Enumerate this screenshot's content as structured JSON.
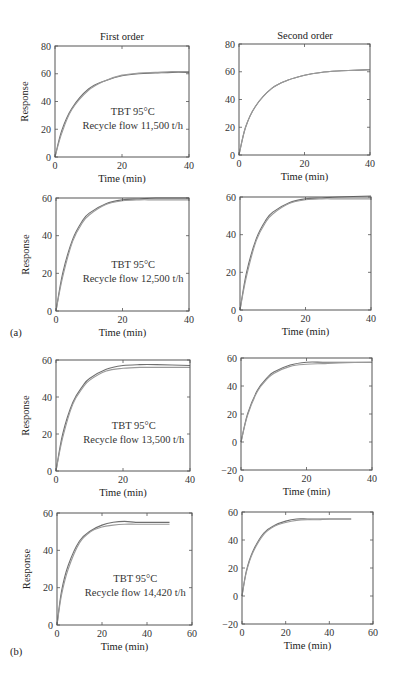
{
  "figure": {
    "column_titles": [
      "First order",
      "Second order"
    ],
    "part_labels": [
      "(a)",
      "(b)"
    ],
    "xlabel": "Time (min)",
    "ylabel": "Response",
    "annotation_line1": "TBT 95°C",
    "line_color": "#777777"
  },
  "chart_data": [
    {
      "type": "line",
      "title": "First order",
      "row": 0,
      "col": 0,
      "annotation": [
        "TBT 95°C",
        "Recycle flow 11,500 t/h"
      ],
      "xlabel": "Time (min)",
      "ylabel": "Response",
      "xlim": [
        0,
        40
      ],
      "ylim": [
        0,
        80
      ],
      "xticks": [
        0,
        20,
        40
      ],
      "yticks": [
        0,
        20,
        40,
        60,
        80
      ],
      "series": [
        {
          "name": "measured",
          "x": [
            0,
            2,
            5,
            10,
            15,
            20,
            25,
            30,
            35,
            40
          ],
          "y": [
            0,
            19,
            35,
            49,
            55,
            58.5,
            60,
            60.5,
            61,
            61
          ]
        },
        {
          "name": "first-order model",
          "x": [
            0,
            2,
            5,
            10,
            15,
            20,
            25,
            30,
            35,
            40
          ],
          "y": [
            0,
            17,
            34,
            48,
            55,
            59,
            60.5,
            61,
            61.5,
            61.5
          ]
        }
      ]
    },
    {
      "type": "line",
      "title": "Second order",
      "row": 0,
      "col": 1,
      "xlabel": "Time (min)",
      "ylabel": "",
      "xlim": [
        0,
        40
      ],
      "ylim": [
        0,
        80
      ],
      "xticks": [
        0,
        20,
        40
      ],
      "yticks": [
        0,
        20,
        40,
        60,
        80
      ],
      "series": [
        {
          "name": "measured",
          "x": [
            0,
            2,
            5,
            10,
            15,
            20,
            25,
            30,
            35,
            40
          ],
          "y": [
            0,
            20,
            35,
            48,
            54,
            57.5,
            59.5,
            60.5,
            61,
            61.5
          ]
        },
        {
          "name": "second-order model",
          "x": [
            0,
            2,
            5,
            10,
            15,
            20,
            25,
            30,
            35,
            40
          ],
          "y": [
            0,
            20,
            35,
            48,
            54,
            57.5,
            59.5,
            60.5,
            61,
            61.5
          ]
        }
      ]
    },
    {
      "type": "line",
      "title": "",
      "row": 1,
      "col": 0,
      "annotation": [
        "TBT 95°C",
        "Recycle flow 12,500 t/h"
      ],
      "xlabel": "Time (min)",
      "ylabel": "Response",
      "xlim": [
        0,
        40
      ],
      "ylim": [
        0,
        60
      ],
      "xticks": [
        0,
        20,
        40
      ],
      "yticks": [
        0,
        20,
        40,
        60
      ],
      "series": [
        {
          "name": "measured",
          "x": [
            0,
            2,
            5,
            8,
            10,
            15,
            20,
            25,
            30,
            40
          ],
          "y": [
            0,
            20,
            38,
            48,
            52,
            57,
            59,
            59.5,
            60,
            60
          ]
        },
        {
          "name": "first-order model",
          "x": [
            0,
            2,
            5,
            8,
            10,
            15,
            20,
            25,
            30,
            40
          ],
          "y": [
            0,
            18,
            37,
            47,
            51,
            56.5,
            58.5,
            59,
            59,
            59
          ]
        }
      ]
    },
    {
      "type": "line",
      "title": "",
      "row": 1,
      "col": 1,
      "xlabel": "Time (min)",
      "ylabel": "",
      "xlim": [
        0,
        40
      ],
      "ylim": [
        0,
        60
      ],
      "xticks": [
        0,
        20,
        40
      ],
      "yticks": [
        0,
        20,
        40,
        60
      ],
      "series": [
        {
          "name": "measured",
          "x": [
            0,
            2,
            5,
            8,
            10,
            15,
            20,
            25,
            30,
            40
          ],
          "y": [
            0,
            20,
            38,
            48,
            52,
            57,
            59,
            59.5,
            60,
            60.5
          ]
        },
        {
          "name": "second-order model",
          "x": [
            0,
            2,
            5,
            8,
            10,
            15,
            20,
            25,
            30,
            40
          ],
          "y": [
            0,
            18,
            37,
            47,
            51,
            56.5,
            58.5,
            59,
            59,
            59
          ]
        }
      ]
    },
    {
      "type": "line",
      "title": "",
      "row": 2,
      "col": 0,
      "annotation": [
        "TBT 95°C",
        "Recycle flow 13,500 t/h"
      ],
      "xlabel": "Time (min)",
      "ylabel": "Response",
      "xlim": [
        0,
        40
      ],
      "ylim": [
        0,
        60
      ],
      "xticks": [
        0,
        20,
        40
      ],
      "yticks": [
        0,
        20,
        40,
        60
      ],
      "series": [
        {
          "name": "measured",
          "x": [
            0,
            2,
            5,
            8,
            10,
            15,
            20,
            25,
            30,
            40
          ],
          "y": [
            0,
            20,
            37,
            46,
            50,
            55,
            57,
            57.5,
            57.5,
            57
          ]
        },
        {
          "name": "first-order model",
          "x": [
            0,
            2,
            5,
            8,
            10,
            15,
            20,
            25,
            30,
            40
          ],
          "y": [
            0,
            18,
            36,
            45,
            49,
            54,
            55.5,
            56,
            56,
            56
          ]
        }
      ]
    },
    {
      "type": "line",
      "title": "",
      "row": 2,
      "col": 1,
      "xlabel": "Time (min)",
      "ylabel": "",
      "xlim": [
        0,
        40
      ],
      "ylim": [
        -20,
        60
      ],
      "xticks": [
        0,
        20,
        40
      ],
      "yticks": [
        -20,
        0,
        20,
        40,
        60
      ],
      "series": [
        {
          "name": "measured",
          "x": [
            0,
            2,
            5,
            8,
            10,
            15,
            20,
            25,
            30,
            40
          ],
          "y": [
            0,
            20,
            37,
            46,
            50,
            55,
            57,
            57,
            57,
            57
          ]
        },
        {
          "name": "second-order model",
          "x": [
            0,
            2,
            5,
            8,
            10,
            15,
            20,
            25,
            30,
            40
          ],
          "y": [
            0,
            19,
            36,
            45,
            49,
            54,
            55.5,
            56,
            56.5,
            57
          ]
        }
      ]
    },
    {
      "type": "line",
      "title": "",
      "row": 3,
      "col": 0,
      "annotation": [
        "TBT 95°C",
        "Recycle flow 14,420 t/h"
      ],
      "xlabel": "Time (min)",
      "ylabel": "Response",
      "xlim": [
        0,
        60
      ],
      "ylim": [
        0,
        60
      ],
      "xticks": [
        0,
        20,
        40,
        60
      ],
      "yticks": [
        0,
        20,
        40,
        60
      ],
      "series": [
        {
          "name": "measured",
          "x": [
            0,
            2,
            5,
            10,
            15,
            20,
            25,
            30,
            35,
            40,
            50
          ],
          "y": [
            0,
            18,
            32,
            45,
            50.5,
            53.5,
            55,
            55.5,
            55,
            55,
            55
          ]
        },
        {
          "name": "first-order model",
          "x": [
            0,
            2,
            5,
            10,
            15,
            20,
            25,
            30,
            35,
            40,
            50
          ],
          "y": [
            0,
            16,
            30,
            44,
            50,
            52.5,
            53.5,
            54,
            54,
            54,
            54
          ]
        }
      ]
    },
    {
      "type": "line",
      "title": "",
      "row": 3,
      "col": 1,
      "xlabel": "Time (min)",
      "ylabel": "",
      "xlim": [
        0,
        60
      ],
      "ylim": [
        -20,
        60
      ],
      "xticks": [
        0,
        20,
        40,
        60
      ],
      "yticks": [
        -20,
        0,
        20,
        40,
        60
      ],
      "series": [
        {
          "name": "measured",
          "x": [
            0,
            2,
            5,
            10,
            15,
            20,
            25,
            30,
            35,
            40,
            50
          ],
          "y": [
            0,
            18,
            32,
            45,
            50.5,
            53.5,
            55,
            55,
            55,
            55,
            55
          ]
        },
        {
          "name": "second-order model",
          "x": [
            0,
            2,
            5,
            10,
            15,
            20,
            25,
            30,
            35,
            40,
            50
          ],
          "y": [
            0,
            17,
            31,
            44,
            50,
            52.5,
            54,
            54.5,
            54.5,
            55,
            55
          ]
        }
      ]
    }
  ]
}
